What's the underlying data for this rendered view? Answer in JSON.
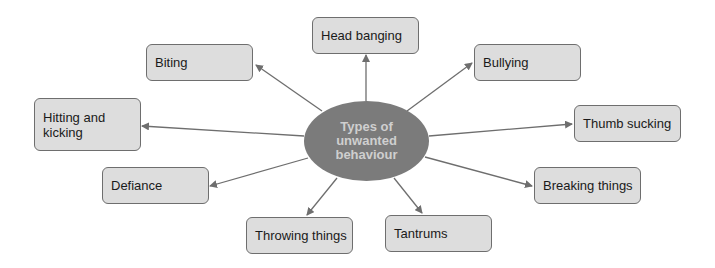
{
  "diagram": {
    "center": {
      "label": "Types of unwanted behaviour"
    },
    "nodes": [
      {
        "id": "head-banging",
        "label": "Head banging"
      },
      {
        "id": "biting",
        "label": "Biting"
      },
      {
        "id": "bullying",
        "label": "Bullying"
      },
      {
        "id": "hitting-and-kicking",
        "label": "Hitting and kicking"
      },
      {
        "id": "thumb-sucking",
        "label": "Thumb sucking"
      },
      {
        "id": "defiance",
        "label": "Defiance"
      },
      {
        "id": "breaking-things",
        "label": "Breaking things"
      },
      {
        "id": "throwing-things",
        "label": "Throwing things"
      },
      {
        "id": "tantrums",
        "label": "Tantrums"
      }
    ],
    "colors": {
      "center_fill": "#7b7b7b",
      "center_text": "#cfcfcf",
      "node_fill": "#dddddd",
      "node_border": "#6e6e6e",
      "arrow": "#6e6e6e"
    }
  }
}
